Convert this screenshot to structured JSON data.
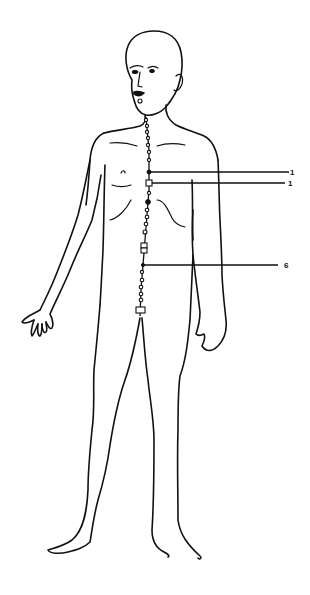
{
  "diagram": {
    "type": "anatomical-meridian-chart",
    "view": "front",
    "meridian": {
      "path": "anterior midline, from lower lip/chin down to pubic area",
      "point_count_visible": 24
    },
    "labels": [
      {
        "id": "label-1a",
        "text": "1",
        "y": 172
      },
      {
        "id": "label-1b",
        "text": "1",
        "y": 183
      },
      {
        "id": "label-6",
        "text": "6",
        "y": 265
      }
    ],
    "colors": {
      "line": "#111111",
      "background": "#ffffff"
    }
  }
}
